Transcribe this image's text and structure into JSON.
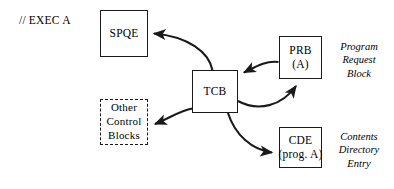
{
  "diagram": {
    "jcl_label": "// EXEC A",
    "stroke_color": "#1a1a1a",
    "background_color": "#ffffff",
    "nodes": {
      "spqe": {
        "label": "SPQE"
      },
      "tcb": {
        "label": "TCB"
      },
      "prb": {
        "line1": "PRB",
        "line2": "(A)"
      },
      "cde": {
        "line1": "CDE",
        "line2": "(prog. A)"
      },
      "other": {
        "line1": "Other",
        "line2": "Control",
        "line3": "Blocks"
      }
    },
    "captions": {
      "prb": {
        "line1": "Program",
        "line2": "Request",
        "line3": "Block"
      },
      "cde": {
        "line1": "Contents",
        "line2": "Directory",
        "line3": "Entry"
      }
    },
    "edges": [
      {
        "name": "tcb-to-spqe",
        "from": "tcb",
        "to": "spqe"
      },
      {
        "name": "prb-to-tcb",
        "from": "prb",
        "to": "tcb"
      },
      {
        "name": "tcb-to-prb",
        "from": "tcb",
        "to": "prb"
      },
      {
        "name": "tcb-to-other-control-blocks",
        "from": "tcb",
        "to": "other"
      },
      {
        "name": "tcb-to-cde",
        "from": "tcb",
        "to": "cde"
      }
    ]
  }
}
